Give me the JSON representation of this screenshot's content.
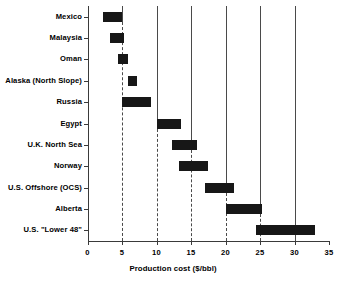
{
  "chart_data": {
    "type": "bar",
    "orientation": "horizontal",
    "subtype": "range-bar",
    "title": "",
    "xlabel": "Production cost ($/bbl)",
    "ylabel": "",
    "xlim": [
      0,
      35
    ],
    "xticks": [
      0,
      5,
      10,
      15,
      20,
      25,
      30,
      35
    ],
    "xtick_labels": [
      "0",
      "5",
      "10",
      "15",
      "20",
      "25",
      "30",
      "35"
    ],
    "grid": "vertical gridlines at 5,10,15,20,25,30; solid above each category row, dashed below",
    "legend": "none",
    "categories": [
      "Mexico",
      "Malaysia",
      "Oman",
      "Alaska (North Slope)",
      "Russia",
      "Egypt",
      "U.K. North Sea",
      "Norway",
      "U.S. Offshore (OCS)",
      "Alberta",
      "U.S. \"Lower 48\""
    ],
    "ranges": [
      {
        "category": "Mexico",
        "low": 2.3,
        "high": 5.0
      },
      {
        "category": "Malaysia",
        "low": 3.2,
        "high": 5.3
      },
      {
        "category": "Oman",
        "low": 4.4,
        "high": 5.9
      },
      {
        "category": "Alaska (North Slope)",
        "low": 5.8,
        "high": 7.2
      },
      {
        "category": "Russia",
        "low": 5.0,
        "high": 9.2
      },
      {
        "category": "Egypt",
        "low": 10.0,
        "high": 13.6
      },
      {
        "category": "U.K. North Sea",
        "low": 12.3,
        "high": 15.8
      },
      {
        "category": "Norway",
        "low": 13.3,
        "high": 17.5
      },
      {
        "category": "U.S. Offshore (OCS)",
        "low": 17.0,
        "high": 21.3
      },
      {
        "category": "Alberta",
        "low": 20.0,
        "high": 25.3
      },
      {
        "category": "U.S. \"Lower 48\"",
        "low": 24.4,
        "high": 32.9
      }
    ],
    "colors": {
      "bar": "#171717",
      "axis": "#3a3a3a",
      "grid": "#4a4a4a",
      "background": "#ffffff"
    }
  }
}
